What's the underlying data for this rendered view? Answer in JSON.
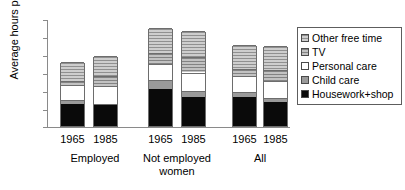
{
  "chart_data": {
    "type": "bar",
    "subtype": "stacked",
    "title": "",
    "xlabel": "",
    "ylabel": "Average hours per week",
    "ylim": [
      0,
      120
    ],
    "yticks": [
      0,
      20,
      40,
      60,
      80,
      100,
      120
    ],
    "grid": false,
    "legend_position": "right",
    "groups": [
      {
        "label": "Employed",
        "categories": [
          "1965",
          "1985"
        ]
      },
      {
        "label": "Not employed women",
        "label_line1": "Not employed",
        "label_line2": "women",
        "categories": [
          "1965",
          "1985"
        ]
      },
      {
        "label": "All",
        "categories": [
          "1965",
          "1985"
        ]
      }
    ],
    "categories": [
      "Employed 1965",
      "Employed 1985",
      "Not employed 1965",
      "Not employed 1985",
      "All 1965",
      "All 1985"
    ],
    "series": [
      {
        "name": "Housework+shop",
        "color": "#0a0a0a",
        "values": [
          25,
          23,
          42,
          32,
          33,
          27
        ]
      },
      {
        "name": "Child care",
        "color": "#9a9a9a",
        "values": [
          4,
          2,
          10,
          7,
          5,
          4
        ]
      },
      {
        "name": "Personal care",
        "color": "#ffffff",
        "values": [
          17,
          20,
          18,
          21,
          18,
          19
        ]
      },
      {
        "name": "TV",
        "color": "#a8a8a8",
        "values": [
          5,
          11,
          12,
          17,
          8,
          13
        ]
      },
      {
        "name": "Other free time",
        "color": "#b4b4b4",
        "values": [
          21,
          23,
          28,
          29,
          27,
          27
        ]
      }
    ],
    "totals": [
      72,
      79,
      110,
      106,
      91,
      90
    ]
  },
  "legend": {
    "items": [
      {
        "label": "Other free time",
        "swatch": "hatched-light-gray"
      },
      {
        "label": "TV",
        "swatch": "hatched-gray"
      },
      {
        "label": "Personal care",
        "swatch": "white"
      },
      {
        "label": "Child care",
        "swatch": "gray"
      },
      {
        "label": "Housework+shop",
        "swatch": "black"
      }
    ]
  }
}
